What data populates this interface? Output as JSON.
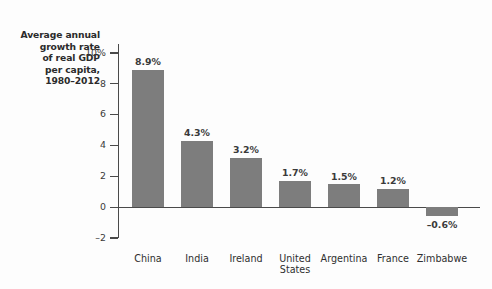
{
  "chart_data": {
    "type": "bar",
    "title": "Average annual growth rate of real GDP per capita, 1980–2012",
    "title_lines": [
      "Average annual",
      "growth rate",
      "of real GDP",
      "per capita,",
      "1980–2012"
    ],
    "categories": [
      "China",
      "India",
      "Ireland",
      "United States",
      "Argentina",
      "France",
      "Zimbabwe"
    ],
    "category_label_lines": [
      [
        "China"
      ],
      [
        "India"
      ],
      [
        "Ireland"
      ],
      [
        "United",
        "States"
      ],
      [
        "Argentina"
      ],
      [
        "France"
      ],
      [
        "Zimbabwe"
      ]
    ],
    "values": [
      8.9,
      4.3,
      3.2,
      1.7,
      1.5,
      1.2,
      -0.6
    ],
    "data_labels": [
      "8.9%",
      "4.3%",
      "3.2%",
      "1.7%",
      "1.5%",
      "1.2%",
      "–0.6%"
    ],
    "xlabel": "",
    "ylabel": "",
    "ylim": [
      -2,
      10
    ],
    "yticks": [
      10,
      8,
      6,
      4,
      2,
      0,
      -2
    ],
    "ytick_labels": [
      "10%",
      "8",
      "6",
      "4",
      "2",
      "0",
      "–2"
    ],
    "grid": false,
    "legend": false,
    "bar_color": "#7d7d7d",
    "axis_color": "#4a4a4a",
    "text_color": "#3a3a3a",
    "background": "#fdfdfd"
  }
}
